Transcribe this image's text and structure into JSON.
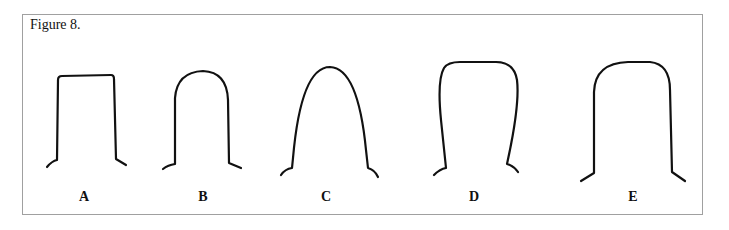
{
  "figure": {
    "title": "Figure 8.",
    "stroke_color": "#111111",
    "border_color": "#a0a0a0",
    "shapes": [
      {
        "label": "A",
        "description": "flat top, sharp corners, straight vertical sides"
      },
      {
        "label": "B",
        "description": "narrow rounded top, straight vertical sides"
      },
      {
        "label": "C",
        "description": "tapered parabolic arch, sides widening downward"
      },
      {
        "label": "D",
        "description": "flat wide top with rounded corners, sides narrowing downward"
      },
      {
        "label": "E",
        "description": "flat wide top with rounded corners, straight vertical sides"
      }
    ]
  }
}
